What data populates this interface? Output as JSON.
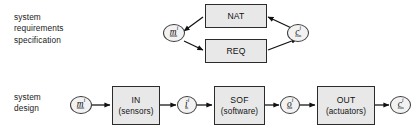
{
  "diagram": {
    "colors": {
      "box_fill": "#e8e8e8",
      "ellipse_fill": "#f2f2f2",
      "stroke": "#2b2b2b",
      "text": "#111111",
      "background": "#ffffff"
    },
    "rows": {
      "requirements": {
        "caption_line1": "system",
        "caption_line2": "requirements",
        "caption_line3": "specification"
      },
      "design": {
        "caption_line1": "system",
        "caption_line2": "design"
      }
    },
    "boxes": [
      {
        "id": "nat",
        "label": "NAT",
        "sublabel": "",
        "row": "requirements"
      },
      {
        "id": "req",
        "label": "REQ",
        "sublabel": "",
        "row": "requirements"
      },
      {
        "id": "in",
        "label": "IN",
        "sublabel": "(sensors)",
        "row": "design"
      },
      {
        "id": "sof",
        "label": "SOF",
        "sublabel": "(software)",
        "row": "design"
      },
      {
        "id": "out",
        "label": "OUT",
        "sublabel": "(actuators)",
        "row": "design"
      }
    ],
    "nodes": [
      {
        "id": "m-req",
        "symbol": "m",
        "superscript": "i",
        "subscript": "mon",
        "row": "requirements"
      },
      {
        "id": "c-req",
        "symbol": "c",
        "superscript": "i",
        "subscript": "con",
        "row": "requirements"
      },
      {
        "id": "m-des",
        "symbol": "m",
        "superscript": "i",
        "subscript": "mon",
        "row": "design"
      },
      {
        "id": "i-des",
        "symbol": "i",
        "superscript": "i",
        "subscript": "in",
        "row": "design"
      },
      {
        "id": "o-des",
        "symbol": "o",
        "superscript": "i",
        "subscript": "out",
        "row": "design"
      },
      {
        "id": "c-des",
        "symbol": "c",
        "superscript": "i",
        "subscript": "con",
        "row": "design"
      }
    ],
    "edges": [
      {
        "id": "edge-c-to-nat",
        "from": "c-req",
        "to": "nat"
      },
      {
        "id": "edge-nat-to-m",
        "from": "nat",
        "to": "m-req"
      },
      {
        "id": "edge-m-to-req",
        "from": "m-req",
        "to": "req"
      },
      {
        "id": "edge-req-to-c",
        "from": "req",
        "to": "c-req"
      },
      {
        "id": "edge-m-to-in",
        "from": "m-des",
        "to": "in"
      },
      {
        "id": "edge-in-to-i",
        "from": "in",
        "to": "i-des"
      },
      {
        "id": "edge-i-to-sof",
        "from": "i-des",
        "to": "sof"
      },
      {
        "id": "edge-sof-to-o",
        "from": "sof",
        "to": "o-des"
      },
      {
        "id": "edge-o-to-out",
        "from": "o-des",
        "to": "out"
      },
      {
        "id": "edge-out-to-c",
        "from": "out",
        "to": "c-des"
      }
    ]
  }
}
